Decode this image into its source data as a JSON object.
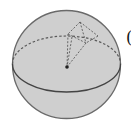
{
  "figure": {
    "colors": {
      "sphere_fill": "#cfcfcf",
      "sphere_stroke": "#6a6a6a",
      "equator_front": "#444444",
      "dashed_lines": "#5a5a5a",
      "center_point": "#222222"
    },
    "sphere": {
      "cx": 66.5,
      "cy": 64.5,
      "r": 54
    },
    "equator": {
      "cx": 66.5,
      "cy": 64,
      "rx": 54,
      "ry": 28
    },
    "center_point": {
      "x": 67,
      "y": 67
    },
    "pyramid": {
      "apex": {
        "x": 80,
        "y": 22
      },
      "left": {
        "x": 68,
        "y": 34
      },
      "right": {
        "x": 98,
        "y": 36
      },
      "front": {
        "x": 86,
        "y": 43
      }
    }
  },
  "edge_text": "("
}
